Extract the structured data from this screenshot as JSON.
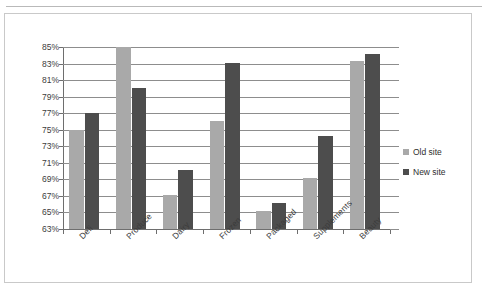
{
  "figure": {
    "frame_color": "#c9c9c9",
    "background": "#ffffff"
  },
  "legend": {
    "position": "right",
    "items": [
      {
        "label": "Old site",
        "color": "#a9a9a9",
        "marker": "square-swatch"
      },
      {
        "label": "New site",
        "color": "#4d4d4d",
        "marker": "square-swatch"
      }
    ]
  },
  "chart_data": {
    "type": "bar",
    "title": "",
    "subtitle": "",
    "xlabel": "",
    "ylabel": "",
    "categories": [
      "Deli",
      "Produce",
      "Dairy",
      "Frozen",
      "Packaged",
      "Supplements",
      "Beauty"
    ],
    "series": [
      {
        "name": "Old site",
        "color": "#a9a9a9",
        "values": [
          75.0,
          85.0,
          67.1,
          76.0,
          65.2,
          69.2,
          83.3
        ]
      },
      {
        "name": "New site",
        "color": "#4d4d4d",
        "values": [
          77.0,
          80.0,
          70.1,
          83.1,
          66.2,
          74.2,
          84.2
        ]
      }
    ],
    "ylim": [
      63,
      85
    ],
    "ytick_values": [
      63,
      65,
      67,
      69,
      71,
      73,
      75,
      77,
      79,
      81,
      83,
      85
    ],
    "ytick_labels": [
      "63%",
      "65%",
      "67%",
      "69%",
      "71%",
      "73%",
      "75%",
      "77%",
      "79%",
      "81%",
      "83%",
      "85%"
    ],
    "value_suffix": "%",
    "grid": true,
    "grid_axis": "y",
    "legend_position": "right",
    "xtick_label_rotation": -45
  }
}
